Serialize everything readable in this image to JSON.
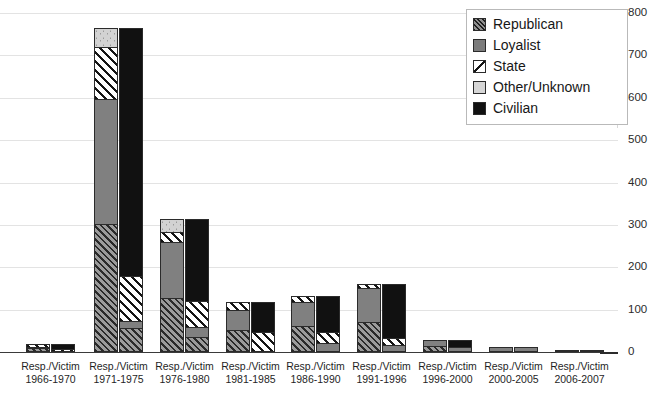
{
  "chart_data": {
    "type": "bar",
    "subtype": "stacked-bar-paired",
    "title": "",
    "xlabel": "",
    "ylabel": "",
    "ylim": [
      0,
      800
    ],
    "yticks": [
      0,
      100,
      200,
      300,
      400,
      500,
      600,
      700,
      800
    ],
    "ytick_labels": [
      "0",
      "100",
      "200",
      "300",
      "400",
      "500",
      "600",
      "700",
      "800"
    ],
    "grid": true,
    "legend_position": "top-right",
    "stack_order_bottom_to_top": [
      "Republican",
      "Loyalist",
      "State",
      "Other/Unknown",
      "Civilian"
    ],
    "legend": [
      {
        "label": "Republican",
        "pattern": "dense-diagonal-hatch",
        "color": "#8f8f8f"
      },
      {
        "label": "Loyalist",
        "pattern": "solid",
        "color": "#7c7c7c"
      },
      {
        "label": "State",
        "pattern": "wide-diagonal-stripe",
        "color": "#ffffff"
      },
      {
        "label": "Other/Unknown",
        "pattern": "light-speckle",
        "color": "#d6d6d6"
      },
      {
        "label": "Civilian",
        "pattern": "solid",
        "color": "#111111"
      }
    ],
    "categories": [
      {
        "period": "1966-1970",
        "line1": "Resp./Victim",
        "line2": "1966-1970"
      },
      {
        "period": "1971-1975",
        "line1": "Resp./Victim",
        "line2": "1971-1975"
      },
      {
        "period": "1976-1980",
        "line1": "Resp./Victim",
        "line2": "1976-1980"
      },
      {
        "period": "1981-1985",
        "line1": "Resp./Victim",
        "line2": "1981-1985"
      },
      {
        "period": "1986-1990",
        "line1": "Resp./Victim",
        "line2": "1986-1990"
      },
      {
        "period": "1991-1996",
        "line1": "Resp./Victim",
        "line2": "1991-1996"
      },
      {
        "period": "1996-2000",
        "line1": "Resp./Victim",
        "line2": "1996-2000"
      },
      {
        "period": "2000-2005",
        "line1": "Resp./Victim",
        "line2": "2000-2005"
      },
      {
        "period": "2006-2007",
        "line1": "Resp./Victim",
        "line2": "2006-2007"
      }
    ],
    "bars": [
      {
        "period": "1966-1970",
        "responsibility": {
          "Republican": 8,
          "Loyalist": 2,
          "State": 8,
          "Other/Unknown": 0,
          "Civilian": 0,
          "total": 18
        },
        "victim": {
          "Republican": 0,
          "Loyalist": 0,
          "State": 2,
          "Other/Unknown": 0,
          "Civilian": 16,
          "total": 18
        }
      },
      {
        "period": "1971-1975",
        "responsibility": {
          "Republican": 300,
          "Loyalist": 295,
          "State": 125,
          "Other/Unknown": 45,
          "Civilian": 0,
          "total": 765
        },
        "victim": {
          "Republican": 52,
          "Loyalist": 18,
          "State": 105,
          "Other/Unknown": 0,
          "Civilian": 590,
          "total": 765
        }
      },
      {
        "period": "1976-1980",
        "responsibility": {
          "Republican": 125,
          "Loyalist": 135,
          "State": 22,
          "Other/Unknown": 33,
          "Civilian": 0,
          "total": 315
        },
        "victim": {
          "Republican": 32,
          "Loyalist": 22,
          "State": 63,
          "Other/Unknown": 0,
          "Civilian": 198,
          "total": 315
        }
      },
      {
        "period": "1981-1985",
        "responsibility": {
          "Republican": 50,
          "Loyalist": 48,
          "State": 20,
          "Other/Unknown": 0,
          "Civilian": 0,
          "total": 118
        },
        "victim": {
          "Republican": 0,
          "Loyalist": 0,
          "State": 45,
          "Other/Unknown": 0,
          "Civilian": 73,
          "total": 118
        }
      },
      {
        "period": "1986-1990",
        "responsibility": {
          "Republican": 60,
          "Loyalist": 58,
          "State": 14,
          "Other/Unknown": 0,
          "Civilian": 0,
          "total": 132
        },
        "victim": {
          "Republican": 0,
          "Loyalist": 18,
          "State": 25,
          "Other/Unknown": 0,
          "Civilian": 89,
          "total": 132
        }
      },
      {
        "period": "1991-1996",
        "responsibility": {
          "Republican": 68,
          "Loyalist": 82,
          "State": 10,
          "Other/Unknown": 0,
          "Civilian": 0,
          "total": 160
        },
        "victim": {
          "Republican": 0,
          "Loyalist": 12,
          "State": 18,
          "Other/Unknown": 0,
          "Civilian": 130,
          "total": 160
        }
      },
      {
        "period": "1996-2000",
        "responsibility": {
          "Republican": 12,
          "Loyalist": 16,
          "State": 0,
          "Other/Unknown": 0,
          "Civilian": 0,
          "total": 28
        },
        "victim": {
          "Republican": 0,
          "Loyalist": 8,
          "State": 0,
          "Other/Unknown": 0,
          "Civilian": 20,
          "total": 28
        }
      },
      {
        "period": "2000-2005",
        "responsibility": {
          "Republican": 0,
          "Loyalist": 12,
          "State": 0,
          "Other/Unknown": 0,
          "Civilian": 0,
          "total": 12
        },
        "victim": {
          "Republican": 0,
          "Loyalist": 12,
          "State": 0,
          "Other/Unknown": 0,
          "Civilian": 0,
          "total": 12
        }
      },
      {
        "period": "2006-2007",
        "responsibility": {
          "Republican": 0,
          "Loyalist": 2,
          "State": 0,
          "Other/Unknown": 0,
          "Civilian": 0,
          "total": 2
        },
        "victim": {
          "Republican": 0,
          "Loyalist": 0,
          "State": 0,
          "Other/Unknown": 0,
          "Civilian": 2,
          "total": 2
        }
      }
    ]
  }
}
